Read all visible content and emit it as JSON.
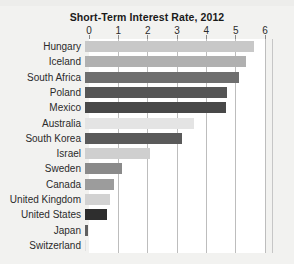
{
  "chart_data": {
    "type": "bar",
    "orientation": "horizontal",
    "title": "Short-Term Interest Rate, 2012",
    "xlabel": "",
    "ylabel": "",
    "xlim": [
      0,
      6
    ],
    "xticks": [
      0,
      1,
      2,
      3,
      4,
      5,
      6
    ],
    "xtick_labels": [
      "0",
      "1",
      "2",
      "3",
      "4",
      "5",
      "6"
    ],
    "grid": true,
    "legend": "none",
    "categories": [
      "Hungary",
      "Iceland",
      "South Africa",
      "Poland",
      "Mexico",
      "Australia",
      "South Korea",
      "Israel",
      "Sweden",
      "Canada",
      "United Kingdom",
      "United States",
      "Japan",
      "Switzerland"
    ],
    "values": [
      5.75,
      5.5,
      5.25,
      4.85,
      4.8,
      3.7,
      3.3,
      2.2,
      1.25,
      1.0,
      0.85,
      0.75,
      0.1,
      0.05
    ],
    "bar_colors": [
      "#c8c8c8",
      "#b0b0b0",
      "#6e6e6e",
      "#555555",
      "#484848",
      "#e4e4e4",
      "#5a5a5a",
      "#cfcfcf",
      "#8a8a8a",
      "#9c9c9c",
      "#d2d2d2",
      "#2e2e2e",
      "#606060",
      "#e0e0e0"
    ]
  },
  "style": {
    "page_background": "#f2f2f0",
    "plot_background": "#ffffff",
    "gridline_color": "#bdbdbd",
    "text_color": "#2b2b2b",
    "title_color": "#1a1a1a"
  }
}
